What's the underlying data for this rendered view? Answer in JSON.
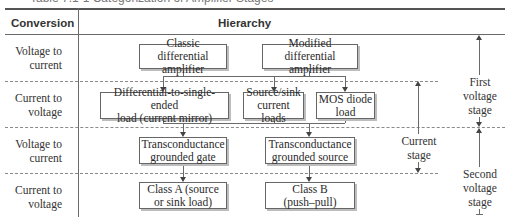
{
  "caption": "Table 7.1-1 Categorization of Amplifier Stages",
  "header": {
    "conversion": "Conversion",
    "hierarchy": "Hierarchy"
  },
  "rows": [
    {
      "label_line1": "Voltage to",
      "label_line2": "current"
    },
    {
      "label_line1": "Current to",
      "label_line2": "voltage"
    },
    {
      "label_line1": "Voltage to",
      "label_line2": "current"
    },
    {
      "label_line1": "Current to",
      "label_line2": "voltage"
    }
  ],
  "boxes": {
    "classic_diff": {
      "line1": "Classic differential",
      "line2": "amplifier"
    },
    "modified_diff": {
      "line1": "Modified differential",
      "line2": "amplifier"
    },
    "diff_to_single": {
      "line1": "Differential-to-single-ended",
      "line2": "load (current mirror)"
    },
    "source_sink": {
      "line1": "Source/sink",
      "line2": "current loads"
    },
    "mos_diode": {
      "line1": "MOS diode",
      "line2": "load"
    },
    "trans_gate": {
      "line1": "Transconductance",
      "line2": "grounded gate"
    },
    "trans_source": {
      "line1": "Transconductance",
      "line2": "grounded source"
    },
    "class_a": {
      "line1": "Class A (source",
      "line2": "or sink load)"
    },
    "class_b": {
      "line1": "Class B",
      "line2": "(push–pull)"
    }
  },
  "stages": {
    "first": {
      "line1": "First",
      "line2": "voltage",
      "line3": "stage"
    },
    "current": {
      "line1": "Current",
      "line2": "stage"
    },
    "second": {
      "line1": "Second",
      "line2": "voltage",
      "line3": "stage"
    }
  }
}
